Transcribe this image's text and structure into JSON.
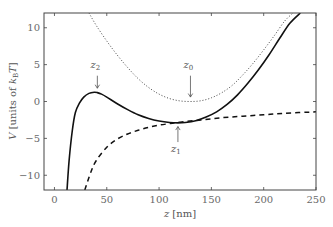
{
  "chart_data": {
    "type": "line",
    "title": "",
    "xlabel": "z [nm]",
    "ylabel": "V [units of k_B T]",
    "xlim": [
      -10,
      250
    ],
    "ylim": [
      -12,
      12
    ],
    "xticks": [
      0,
      50,
      100,
      150,
      200,
      250
    ],
    "yticks": [
      -10,
      -5,
      0,
      5,
      10
    ],
    "grid": false,
    "legend": null,
    "series": [
      {
        "name": "total potential",
        "style": "solid",
        "x": [
          12,
          14,
          17,
          20,
          24,
          28,
          33,
          38,
          41,
          45,
          50,
          60,
          70,
          80,
          90,
          100,
          110,
          118,
          125,
          135,
          145,
          155,
          165,
          175,
          185,
          195,
          205,
          215,
          225,
          235
        ],
        "y": [
          -12,
          -8,
          -4,
          -1.5,
          -0.2,
          0.6,
          1.1,
          1.25,
          1.2,
          1.0,
          0.6,
          -0.3,
          -1.1,
          -1.8,
          -2.3,
          -2.65,
          -2.85,
          -2.9,
          -2.85,
          -2.6,
          -2.1,
          -1.4,
          -0.4,
          0.9,
          2.5,
          4.3,
          6.3,
          8.5,
          10.6,
          12
        ]
      },
      {
        "name": "dotted potential",
        "style": "dotted",
        "x": [
          33,
          40,
          50,
          60,
          70,
          80,
          90,
          100,
          110,
          120,
          130,
          140,
          150,
          160,
          170,
          180,
          190,
          200,
          210,
          220,
          228
        ],
        "y": [
          12,
          10.3,
          8.2,
          6.3,
          4.6,
          3.1,
          1.9,
          1.0,
          0.4,
          0.08,
          0.0,
          0.1,
          0.5,
          1.2,
          2.2,
          3.6,
          5.2,
          7.0,
          8.9,
          10.9,
          12
        ]
      },
      {
        "name": "dashed potential",
        "style": "dashed",
        "x": [
          29,
          35,
          40,
          50,
          60,
          70,
          80,
          90,
          100,
          110,
          120,
          140,
          160,
          180,
          200,
          220,
          250
        ],
        "y": [
          -12,
          -9.5,
          -8.0,
          -6.2,
          -5.1,
          -4.4,
          -3.9,
          -3.5,
          -3.2,
          -3.0,
          -2.8,
          -2.5,
          -2.2,
          -2.0,
          -1.8,
          -1.6,
          -1.4
        ]
      }
    ],
    "annotations": [
      {
        "label": "z",
        "sub": "2",
        "x": 41,
        "y_text": 4.6,
        "arrow": "down",
        "arrow_from": 3.5,
        "arrow_to": 1.8
      },
      {
        "label": "z",
        "sub": "0",
        "x": 130,
        "y_text": 4.6,
        "arrow": "down",
        "arrow_from": 3.5,
        "arrow_to": 0.6
      },
      {
        "label": "z",
        "sub": "1",
        "x": 118,
        "y_text": -6.8,
        "arrow": "up",
        "arrow_from": -5.5,
        "arrow_to": -3.4
      }
    ]
  },
  "labels": {
    "xlabel_main": "z",
    "xlabel_unit": " [nm]",
    "ylabel_main": "V",
    "ylabel_text": " [units of ",
    "ylabel_k": "k",
    "ylabel_sub": "B",
    "ylabel_T": "T",
    "ylabel_close": "]"
  }
}
